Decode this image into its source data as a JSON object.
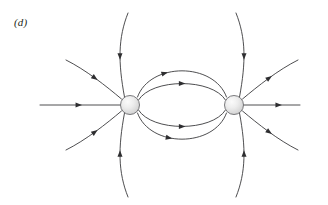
{
  "figure": {
    "panel_label": "(d)",
    "caption_text": "",
    "width": 328,
    "height": 205,
    "background_color": "#ffffff",
    "line_color": "#3a3a3c",
    "arrow_color": "#2e2e30",
    "sphere_fill_light": "#f4f4f4",
    "sphere_fill_mid": "#dcdcdc",
    "sphere_fill_dark": "#c4c4c4",
    "sphere_outline_color": "#6b6b6e"
  },
  "diagram": {
    "type": "electric-field-line-diagram",
    "charges": [
      {
        "name": "left-charge",
        "cx": 130,
        "cy": 105,
        "r": 9.5,
        "polarity": "negative",
        "label": ""
      },
      {
        "name": "right-charge",
        "cx": 234,
        "cy": 105,
        "r": 9.5,
        "polarity": "positive",
        "label": ""
      }
    ],
    "field_lines": [
      {
        "name": "axis-line-left-outer",
        "path": "M 40 105 L 120.5 105",
        "arrows": [
          {
            "t": 0.48,
            "dir": "right"
          }
        ]
      },
      {
        "name": "axis-line-right-outer",
        "path": "M 243.5 105 L 300 105",
        "arrows": [
          {
            "t": 0.62,
            "dir": "right"
          }
        ]
      },
      {
        "name": "left-upper-diagonal",
        "path": "M 66 60 C 86 70 106 86 121.5 99",
        "arrows": [
          {
            "t": 0.5,
            "dir": "downright"
          }
        ]
      },
      {
        "name": "left-lower-diagonal",
        "path": "M 66 150 C 86 140 106 124 121.5 111",
        "arrows": [
          {
            "t": 0.5,
            "dir": "upright"
          }
        ]
      },
      {
        "name": "left-upper-vertical",
        "path": "M 128 13 C 118 38 118 62 124.5 97",
        "arrows": [
          {
            "t": 0.52,
            "dir": "down"
          }
        ]
      },
      {
        "name": "left-lower-vertical",
        "path": "M 128 197 C 118 172 118 148 124.5 113",
        "arrows": [
          {
            "t": 0.52,
            "dir": "up"
          }
        ]
      },
      {
        "name": "left-inner-upper-arc-outer",
        "path": "M 137.5 97 C 150 62 214 62 226.5 97",
        "arrows": [
          {
            "t": 0.34,
            "dir": "right"
          }
        ]
      },
      {
        "name": "left-inner-upper-arc-inner",
        "path": "M 138.5 100 C 152 78 212 78 225.5 100",
        "arrows": [
          {
            "t": 0.5,
            "dir": "right"
          }
        ]
      },
      {
        "name": "left-inner-lower-arc-inner",
        "path": "M 138.5 110 C 152 132 212 132 225.5 110",
        "arrows": [
          {
            "t": 0.5,
            "dir": "right"
          }
        ]
      },
      {
        "name": "left-inner-lower-arc-outer",
        "path": "M 137.5 113 C 150 148 214 148 226.5 113",
        "arrows": [
          {
            "t": 0.38,
            "dir": "right"
          }
        ]
      },
      {
        "name": "right-upper-vertical",
        "path": "M 236 13 C 246 38 246 62 239.5 97",
        "arrows": [
          {
            "t": 0.52,
            "dir": "up"
          }
        ]
      },
      {
        "name": "right-lower-vertical",
        "path": "M 236 197 C 246 172 246 148 239.5 113",
        "arrows": [
          {
            "t": 0.52,
            "dir": "down"
          }
        ]
      },
      {
        "name": "right-upper-diagonal",
        "path": "M 242.5 99 C 258 86 278 70 298 60",
        "arrows": [
          {
            "t": 0.5,
            "dir": "upright"
          }
        ]
      },
      {
        "name": "right-lower-diagonal",
        "path": "M 242.5 111 C 258 124 278 140 298 150",
        "arrows": [
          {
            "t": 0.5,
            "dir": "downright"
          }
        ]
      }
    ]
  }
}
